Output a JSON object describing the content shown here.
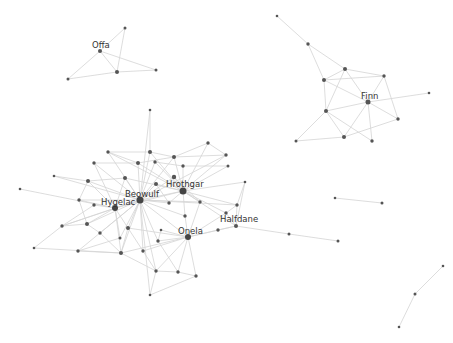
{
  "colors": {
    "background": "#ffffff",
    "edge": "#d4d4d4",
    "node": "#555555",
    "hub": "#444444",
    "label": "#333333"
  },
  "labels": [
    {
      "text": "Offa",
      "x": 92,
      "y": 48
    },
    {
      "text": "Finn",
      "x": 361,
      "y": 99
    },
    {
      "text": "Beowulf",
      "x": 125,
      "y": 197
    },
    {
      "text": "Hrothgar",
      "x": 166,
      "y": 187
    },
    {
      "text": "Hygelac",
      "x": 101,
      "y": 205
    },
    {
      "text": "Onela",
      "x": 178,
      "y": 234
    },
    {
      "text": "Halfdane",
      "x": 220,
      "y": 222
    }
  ],
  "nodes": [
    {
      "id": "offa",
      "x": 100,
      "y": 51,
      "r": 2
    },
    {
      "id": "o1",
      "x": 125,
      "y": 28,
      "r": 1.5
    },
    {
      "id": "o2",
      "x": 68,
      "y": 79,
      "r": 1.5
    },
    {
      "id": "o3",
      "x": 117,
      "y": 72,
      "r": 2
    },
    {
      "id": "o4",
      "x": 156,
      "y": 70,
      "r": 1.5
    },
    {
      "id": "f1",
      "x": 277,
      "y": 16,
      "r": 1.3
    },
    {
      "id": "f2",
      "x": 308,
      "y": 44,
      "r": 1.7
    },
    {
      "id": "f3",
      "x": 345,
      "y": 69,
      "r": 2
    },
    {
      "id": "f4",
      "x": 324,
      "y": 80,
      "r": 2
    },
    {
      "id": "f5",
      "x": 384,
      "y": 76,
      "r": 1.7
    },
    {
      "id": "finn",
      "x": 368,
      "y": 102,
      "r": 2.5
    },
    {
      "id": "f6",
      "x": 429,
      "y": 93,
      "r": 1.3
    },
    {
      "id": "f7",
      "x": 326,
      "y": 111,
      "r": 2
    },
    {
      "id": "f8",
      "x": 398,
      "y": 119,
      "r": 1.7
    },
    {
      "id": "f9",
      "x": 344,
      "y": 137,
      "r": 2
    },
    {
      "id": "f10",
      "x": 296,
      "y": 141,
      "r": 1.5
    },
    {
      "id": "f11",
      "x": 372,
      "y": 141,
      "r": 1.7
    },
    {
      "id": "p1",
      "x": 335,
      "y": 198,
      "r": 1.3
    },
    {
      "id": "p2",
      "x": 382,
      "y": 203,
      "r": 1.5
    },
    {
      "id": "q1",
      "x": 289,
      "y": 234,
      "r": 1.5
    },
    {
      "id": "q2",
      "x": 338,
      "y": 241,
      "r": 1.5
    },
    {
      "id": "s1",
      "x": 443,
      "y": 266,
      "r": 1.3
    },
    {
      "id": "s2",
      "x": 415,
      "y": 294,
      "r": 1.5
    },
    {
      "id": "s3",
      "x": 399,
      "y": 327,
      "r": 1.3
    },
    {
      "id": "beowulf",
      "x": 140,
      "y": 200,
      "r": 3.5
    },
    {
      "id": "hrothgar",
      "x": 183,
      "y": 191,
      "r": 3.5
    },
    {
      "id": "hygelac",
      "x": 115,
      "y": 208,
      "r": 3
    },
    {
      "id": "onela",
      "x": 188,
      "y": 237,
      "r": 3
    },
    {
      "id": "halfdane",
      "x": 236,
      "y": 226,
      "r": 2
    },
    {
      "id": "m1",
      "x": 150,
      "y": 110,
      "r": 1.3
    },
    {
      "id": "m2",
      "x": 150,
      "y": 152,
      "r": 2
    },
    {
      "id": "m3",
      "x": 108,
      "y": 152,
      "r": 1.7
    },
    {
      "id": "m4",
      "x": 94,
      "y": 163,
      "r": 1.7
    },
    {
      "id": "m5",
      "x": 138,
      "y": 163,
      "r": 2
    },
    {
      "id": "m6",
      "x": 155,
      "y": 162,
      "r": 1.7
    },
    {
      "id": "m7",
      "x": 174,
      "y": 157,
      "r": 2
    },
    {
      "id": "m8",
      "x": 208,
      "y": 143,
      "r": 1.7
    },
    {
      "id": "m9",
      "x": 226,
      "y": 155,
      "r": 1.7
    },
    {
      "id": "m10",
      "x": 183,
      "y": 166,
      "r": 1.7
    },
    {
      "id": "m11",
      "x": 228,
      "y": 166,
      "r": 1.5
    },
    {
      "id": "m12",
      "x": 54,
      "y": 176,
      "r": 1.3
    },
    {
      "id": "m13",
      "x": 20,
      "y": 189,
      "r": 1.3
    },
    {
      "id": "m14",
      "x": 88,
      "y": 181,
      "r": 2
    },
    {
      "id": "m15",
      "x": 125,
      "y": 178,
      "r": 2
    },
    {
      "id": "m16",
      "x": 156,
      "y": 184,
      "r": 2
    },
    {
      "id": "m17",
      "x": 174,
      "y": 177,
      "r": 2.2
    },
    {
      "id": "m18",
      "x": 79,
      "y": 200,
      "r": 1.7
    },
    {
      "id": "m19",
      "x": 94,
      "y": 205,
      "r": 1.7
    },
    {
      "id": "m20",
      "x": 169,
      "y": 203,
      "r": 1.7
    },
    {
      "id": "m21",
      "x": 200,
      "y": 202,
      "r": 1.7
    },
    {
      "id": "m22",
      "x": 245,
      "y": 182,
      "r": 1.3
    },
    {
      "id": "m23",
      "x": 237,
      "y": 205,
      "r": 1.7
    },
    {
      "id": "m24",
      "x": 226,
      "y": 213,
      "r": 1.7
    },
    {
      "id": "m25",
      "x": 185,
      "y": 216,
      "r": 1.7
    },
    {
      "id": "m26",
      "x": 62,
      "y": 226,
      "r": 1.7
    },
    {
      "id": "m27",
      "x": 87,
      "y": 224,
      "r": 2
    },
    {
      "id": "m28",
      "x": 100,
      "y": 233,
      "r": 1.7
    },
    {
      "id": "m29",
      "x": 128,
      "y": 228,
      "r": 2
    },
    {
      "id": "m30",
      "x": 161,
      "y": 230,
      "r": 1.3
    },
    {
      "id": "m31",
      "x": 218,
      "y": 230,
      "r": 1.7
    },
    {
      "id": "m32",
      "x": 34,
      "y": 248,
      "r": 1.3
    },
    {
      "id": "m33",
      "x": 78,
      "y": 251,
      "r": 1.7
    },
    {
      "id": "m34",
      "x": 120,
      "y": 238,
      "r": 1.5
    },
    {
      "id": "m35",
      "x": 143,
      "y": 251,
      "r": 1.7
    },
    {
      "id": "m36",
      "x": 121,
      "y": 253,
      "r": 2
    },
    {
      "id": "m37",
      "x": 158,
      "y": 241,
      "r": 1.7
    },
    {
      "id": "m38",
      "x": 156,
      "y": 271,
      "r": 1.7
    },
    {
      "id": "m39",
      "x": 178,
      "y": 272,
      "r": 1.7
    },
    {
      "id": "m40",
      "x": 196,
      "y": 276,
      "r": 1.7
    },
    {
      "id": "m41",
      "x": 150,
      "y": 295,
      "r": 1.3
    }
  ],
  "edges": [
    [
      "offa",
      "o1"
    ],
    [
      "offa",
      "o2"
    ],
    [
      "offa",
      "o3"
    ],
    [
      "offa",
      "o4"
    ],
    [
      "o1",
      "o3"
    ],
    [
      "o2",
      "o3"
    ],
    [
      "o3",
      "o4"
    ],
    [
      "f1",
      "f2"
    ],
    [
      "f2",
      "f3"
    ],
    [
      "f2",
      "f4"
    ],
    [
      "f3",
      "f4"
    ],
    [
      "f3",
      "f5"
    ],
    [
      "f3",
      "finn"
    ],
    [
      "f3",
      "f7"
    ],
    [
      "f4",
      "f5"
    ],
    [
      "f4",
      "finn"
    ],
    [
      "f4",
      "f7"
    ],
    [
      "f5",
      "finn"
    ],
    [
      "f5",
      "f8"
    ],
    [
      "finn",
      "f6"
    ],
    [
      "finn",
      "f7"
    ],
    [
      "finn",
      "f8"
    ],
    [
      "finn",
      "f9"
    ],
    [
      "finn",
      "f11"
    ],
    [
      "f7",
      "f9"
    ],
    [
      "f7",
      "f11"
    ],
    [
      "f7",
      "f10"
    ],
    [
      "f8",
      "f9"
    ],
    [
      "f9",
      "f10"
    ],
    [
      "p1",
      "p2"
    ],
    [
      "q1",
      "q2"
    ],
    [
      "halfdane",
      "q1"
    ],
    [
      "s1",
      "s2"
    ],
    [
      "s2",
      "s3"
    ],
    [
      "beowulf",
      "hrothgar"
    ],
    [
      "beowulf",
      "hygelac"
    ],
    [
      "beowulf",
      "onela"
    ],
    [
      "beowulf",
      "m1"
    ],
    [
      "beowulf",
      "m2"
    ],
    [
      "beowulf",
      "m3"
    ],
    [
      "beowulf",
      "m4"
    ],
    [
      "beowulf",
      "m5"
    ],
    [
      "beowulf",
      "m6"
    ],
    [
      "beowulf",
      "m7"
    ],
    [
      "beowulf",
      "m14"
    ],
    [
      "beowulf",
      "m15"
    ],
    [
      "beowulf",
      "m16"
    ],
    [
      "beowulf",
      "m17"
    ],
    [
      "beowulf",
      "m20"
    ],
    [
      "beowulf",
      "m21"
    ],
    [
      "beowulf",
      "m25"
    ],
    [
      "beowulf",
      "m26"
    ],
    [
      "beowulf",
      "m27"
    ],
    [
      "beowulf",
      "m28"
    ],
    [
      "beowulf",
      "m29"
    ],
    [
      "beowulf",
      "m33"
    ],
    [
      "beowulf",
      "m34"
    ],
    [
      "beowulf",
      "m35"
    ],
    [
      "beowulf",
      "m36"
    ],
    [
      "beowulf",
      "m37"
    ],
    [
      "beowulf",
      "m38"
    ],
    [
      "beowulf",
      "m41"
    ],
    [
      "beowulf",
      "m18"
    ],
    [
      "beowulf",
      "m12"
    ],
    [
      "beowulf",
      "m9"
    ],
    [
      "beowulf",
      "m23"
    ],
    [
      "hrothgar",
      "m2"
    ],
    [
      "hrothgar",
      "m5"
    ],
    [
      "hrothgar",
      "m6"
    ],
    [
      "hrothgar",
      "m7"
    ],
    [
      "hrothgar",
      "m8"
    ],
    [
      "hrothgar",
      "m9"
    ],
    [
      "hrothgar",
      "m10"
    ],
    [
      "hrothgar",
      "m11"
    ],
    [
      "hrothgar",
      "m16"
    ],
    [
      "hrothgar",
      "m17"
    ],
    [
      "hrothgar",
      "m20"
    ],
    [
      "hrothgar",
      "m21"
    ],
    [
      "hrothgar",
      "m22"
    ],
    [
      "hrothgar",
      "m23"
    ],
    [
      "hrothgar",
      "m24"
    ],
    [
      "hrothgar",
      "m25"
    ],
    [
      "hrothgar",
      "hygelac"
    ],
    [
      "hrothgar",
      "halfdane"
    ],
    [
      "hrothgar",
      "m3"
    ],
    [
      "hrothgar",
      "m15"
    ],
    [
      "hygelac",
      "m14"
    ],
    [
      "hygelac",
      "m18"
    ],
    [
      "hygelac",
      "m19"
    ],
    [
      "hygelac",
      "m15"
    ],
    [
      "hygelac",
      "m4"
    ],
    [
      "hygelac",
      "m26"
    ],
    [
      "hygelac",
      "m27"
    ],
    [
      "hygelac",
      "m29"
    ],
    [
      "hygelac",
      "m34"
    ],
    [
      "hygelac",
      "m13"
    ],
    [
      "hygelac",
      "m36"
    ],
    [
      "onela",
      "halfdane"
    ],
    [
      "onela",
      "m31"
    ],
    [
      "onela",
      "m24"
    ],
    [
      "onela",
      "m21"
    ],
    [
      "onela",
      "m25"
    ],
    [
      "onela",
      "m29"
    ],
    [
      "onela",
      "m35"
    ],
    [
      "onela",
      "m37"
    ],
    [
      "onela",
      "m38"
    ],
    [
      "onela",
      "m39"
    ],
    [
      "onela",
      "m40"
    ],
    [
      "onela",
      "m30"
    ],
    [
      "onela",
      "m36"
    ],
    [
      "halfdane",
      "m23"
    ],
    [
      "halfdane",
      "m24"
    ],
    [
      "halfdane",
      "m22"
    ],
    [
      "halfdane",
      "m31"
    ],
    [
      "m23",
      "m24"
    ],
    [
      "m23",
      "m22"
    ],
    [
      "m1",
      "m2"
    ],
    [
      "m2",
      "m3"
    ],
    [
      "m2",
      "m7"
    ],
    [
      "m3",
      "m5"
    ],
    [
      "m4",
      "m5"
    ],
    [
      "m5",
      "m7"
    ],
    [
      "m6",
      "m10"
    ],
    [
      "m7",
      "m8"
    ],
    [
      "m7",
      "m9"
    ],
    [
      "m8",
      "m9"
    ],
    [
      "m10",
      "m11"
    ],
    [
      "m14",
      "m15"
    ],
    [
      "m14",
      "m18"
    ],
    [
      "m14",
      "m12"
    ],
    [
      "m18",
      "m27"
    ],
    [
      "m19",
      "m26"
    ],
    [
      "m26",
      "m32"
    ],
    [
      "m26",
      "m27"
    ],
    [
      "m27",
      "m28"
    ],
    [
      "m28",
      "m36"
    ],
    [
      "m29",
      "m36"
    ],
    [
      "m33",
      "m34"
    ],
    [
      "m33",
      "m36"
    ],
    [
      "m32",
      "m36"
    ],
    [
      "m35",
      "m38"
    ],
    [
      "m36",
      "m38"
    ],
    [
      "m37",
      "m39"
    ],
    [
      "m38",
      "m39"
    ],
    [
      "m39",
      "m40"
    ],
    [
      "m38",
      "m41"
    ],
    [
      "m41",
      "m40"
    ],
    [
      "m29",
      "m35"
    ],
    [
      "m30",
      "m37"
    ],
    [
      "m16",
      "m20"
    ],
    [
      "m17",
      "m21"
    ]
  ]
}
